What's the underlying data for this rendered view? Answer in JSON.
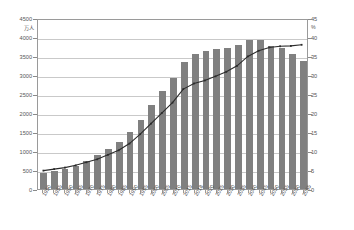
{
  "chart_data": {
    "type": "bar",
    "title": "",
    "subtitle": "",
    "xlabel": "",
    "ylabel": "万人",
    "y2label": "%",
    "ylim": [
      0,
      4500
    ],
    "y2lim": [
      0,
      45
    ],
    "ytick_step": 500,
    "y2tick_step": 5,
    "grid": true,
    "legend_position": "top-right",
    "categories": [
      "1950",
      "1955",
      "1960",
      "1965",
      "1970",
      "1975",
      "1980",
      "1985",
      "1990",
      "1995",
      "2000",
      "2005",
      "2010",
      "2015",
      "2018",
      "2020",
      "2025",
      "2030",
      "2035",
      "2040",
      "2045",
      "2050",
      "2055",
      "2060",
      "2065"
    ],
    "series": [
      {
        "name": "人口",
        "type": "bar",
        "axis": "left",
        "unit": "万人",
        "color": "#808080",
        "values": [
          416,
          475,
          535,
          618,
          733,
          887,
          1065,
          1247,
          1489,
          1826,
          2201,
          2576,
          2925,
          3347,
          3558,
          3619,
          3677,
          3716,
          3782,
          3921,
          3919,
          3768,
          3704,
          3540,
          3381
        ]
      },
      {
        "name": "割合",
        "type": "line",
        "axis": "right",
        "unit": "%",
        "color": "#2b2b2b",
        "values": [
          4.9,
          5.3,
          5.7,
          6.3,
          7.1,
          7.9,
          9.1,
          10.3,
          12.1,
          14.6,
          17.4,
          20.2,
          23.0,
          26.6,
          28.1,
          28.9,
          30.0,
          31.2,
          32.8,
          35.3,
          36.8,
          37.7,
          38.0,
          38.1,
          38.4
        ]
      }
    ],
    "axes": {
      "left_ticks": [
        "0",
        "500",
        "1000",
        "1500",
        "2000",
        "2500",
        "3000",
        "3500",
        "4000",
        "4500"
      ],
      "right_ticks": [
        "0",
        "5",
        "10",
        "15",
        "20",
        "25",
        "30",
        "35",
        "40",
        "45"
      ]
    },
    "annotations": [
      {
        "text": "割合",
        "position": "top-right"
      }
    ]
  },
  "labels": {
    "left_unit": "万人",
    "right_unit": "%",
    "series_label": "割合"
  }
}
